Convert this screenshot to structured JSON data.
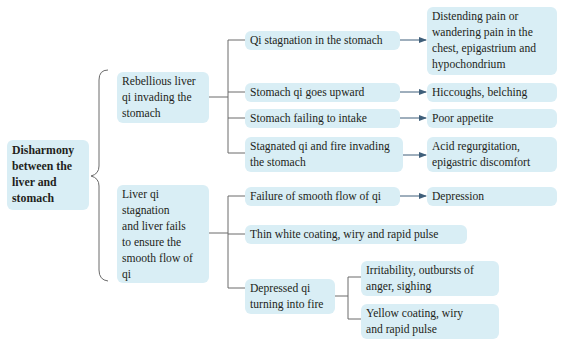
{
  "diagram": {
    "type": "tree",
    "root": {
      "label_lines": [
        "Disharmony",
        "between the",
        "liver and",
        "stomach"
      ]
    },
    "branches": [
      {
        "label_lines": [
          "Rebellious liver",
          "qi invading the",
          "stomach"
        ],
        "children": [
          {
            "label_lines": [
              "Qi stagnation in the stomach"
            ],
            "result_lines": [
              "Distending pain or",
              "wandering pain in the",
              "chest, epigastrium and",
              "hypochondrium"
            ]
          },
          {
            "label_lines": [
              "Stomach qi goes upward"
            ],
            "result_lines": [
              "Hiccoughs, belching"
            ]
          },
          {
            "label_lines": [
              "Stomach failing to intake"
            ],
            "result_lines": [
              "Poor appetite"
            ]
          },
          {
            "label_lines": [
              "Stagnated qi and fire invading",
              "the stomach"
            ],
            "result_lines": [
              "Acid regurgitation,",
              "epigastric discomfort"
            ]
          }
        ]
      },
      {
        "label_lines": [
          "Liver qi",
          "stagnation",
          "and liver fails",
          "to ensure the",
          "smooth flow of",
          "qi"
        ],
        "children": [
          {
            "label_lines": [
              "Failure of smooth flow of qi"
            ],
            "result_lines": [
              "Depression"
            ]
          },
          {
            "label_lines": [
              "Thin white coating, wiry and rapid pulse"
            ]
          },
          {
            "label_lines": [
              "Depressed qi",
              "turning into fire"
            ],
            "sub_children": [
              {
                "label_lines": [
                  "Irritability, outbursts of",
                  "anger, sighing"
                ]
              },
              {
                "label_lines": [
                  "Yellow coating, wiry",
                  "and rapid pulse"
                ]
              }
            ]
          }
        ]
      }
    ],
    "colors": {
      "box_fill": "#d9eef5",
      "line": "#5a5a5a",
      "arrow": "#3f5f7a",
      "text": "#231f20"
    }
  }
}
